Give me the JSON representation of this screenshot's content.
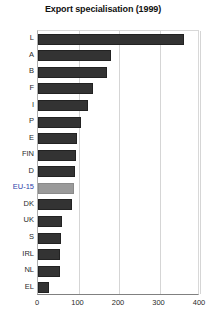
{
  "chart_data": {
    "type": "bar",
    "orientation": "horizontal",
    "title": "Export specialisation (1999)",
    "xlabel": "",
    "ylabel": "",
    "xlim": [
      0,
      400
    ],
    "xticks": [
      0,
      100,
      200,
      300,
      400
    ],
    "xtick_labels": [
      "0",
      "100",
      "200",
      "300",
      "400"
    ],
    "grid": true,
    "legend": null,
    "categories": [
      "L",
      "A",
      "B",
      "F",
      "I",
      "P",
      "E",
      "FIN",
      "D",
      "EU-15",
      "DK",
      "UK",
      "S",
      "IRL",
      "NL",
      "EL"
    ],
    "values": [
      360,
      180,
      170,
      135,
      123,
      106,
      96,
      93,
      91,
      89,
      83,
      59,
      57,
      55,
      55,
      27
    ],
    "highlight_category": "EU-15",
    "bars": [
      {
        "label": "L",
        "value": 360,
        "highlight": false
      },
      {
        "label": "A",
        "value": 180,
        "highlight": false
      },
      {
        "label": "B",
        "value": 170,
        "highlight": false
      },
      {
        "label": "F",
        "value": 135,
        "highlight": false
      },
      {
        "label": "I",
        "value": 123,
        "highlight": false
      },
      {
        "label": "P",
        "value": 106,
        "highlight": false
      },
      {
        "label": "E",
        "value": 96,
        "highlight": false
      },
      {
        "label": "FIN",
        "value": 93,
        "highlight": false
      },
      {
        "label": "D",
        "value": 91,
        "highlight": false
      },
      {
        "label": "EU-15",
        "value": 89,
        "highlight": true
      },
      {
        "label": "DK",
        "value": 83,
        "highlight": false
      },
      {
        "label": "UK",
        "value": 59,
        "highlight": false
      },
      {
        "label": "S",
        "value": 57,
        "highlight": false
      },
      {
        "label": "IRL",
        "value": 55,
        "highlight": false
      },
      {
        "label": "NL",
        "value": 55,
        "highlight": false
      },
      {
        "label": "EL",
        "value": 27,
        "highlight": false
      }
    ],
    "colors": {
      "bar": "#333333",
      "bar_border": "#222222",
      "highlight_bar": "#9a9a9a",
      "highlight_label": "#2c3ea8",
      "grid": "#d5d5d5",
      "axis": "#808080",
      "text": "#2a2a2a",
      "background": "#ffffff"
    }
  }
}
